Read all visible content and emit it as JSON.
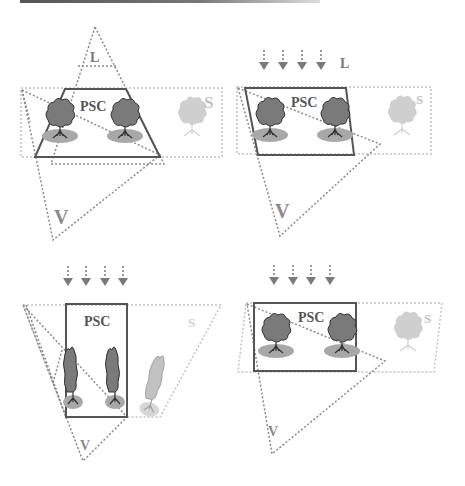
{
  "figure": {
    "colors": {
      "psc_outline": "#555555",
      "frustum_dotted": "#8a8a8a",
      "scene_dotted": "#c2c2c2",
      "tree_canopy": "#7a7a7a",
      "tree_shadow": "#a8a8a8",
      "faded_tree": "#cfcfcf",
      "arrow": "#7a7a7a"
    },
    "panels": [
      {
        "id": "top-left",
        "light_type": "point",
        "labels": {
          "psc": "PSC",
          "light": "L",
          "view": "V",
          "scene": "S"
        },
        "psc_shape": "trapezoid",
        "trees": {
          "inside": 2,
          "outside": 1,
          "style": "round"
        }
      },
      {
        "id": "top-right",
        "light_type": "directional",
        "arrows": 4,
        "labels": {
          "psc": "PSC",
          "light": "L",
          "view": "V",
          "scene": "S"
        },
        "psc_shape": "quadrilateral",
        "trees": {
          "inside": 2,
          "outside": 1,
          "style": "round"
        }
      },
      {
        "id": "bottom-left",
        "light_type": "directional",
        "arrows": 4,
        "labels": {
          "psc": "PSC",
          "view": "V",
          "scene": "S"
        },
        "psc_shape": "tall-rectangle",
        "trees": {
          "inside": 2,
          "outside": 1,
          "style": "tall"
        }
      },
      {
        "id": "bottom-right",
        "light_type": "directional",
        "arrows": 4,
        "labels": {
          "psc": "PSC",
          "view": "V",
          "scene": "S"
        },
        "psc_shape": "rectangle",
        "trees": {
          "inside": 2,
          "outside": 1,
          "style": "round"
        }
      }
    ]
  }
}
